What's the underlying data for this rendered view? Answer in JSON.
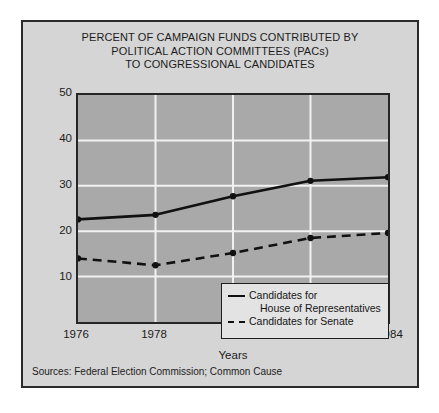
{
  "figure": {
    "title_lines": [
      "PERCENT OF CAMPAIGN FUNDS CONTRIBUTED BY",
      "POLITICAL ACTION COMMITTEES (PACs)",
      "TO CONGRESSIONAL CANDIDATES"
    ],
    "source_note": "Sources: Federal Election Commission; Common Cause",
    "colors": {
      "page_background": "#ffffff",
      "frame_background": "#d5d5d5",
      "plot_background": "#a9a9a9",
      "gridline": "#f2f2f2",
      "line": "#111111",
      "frame_border": "#2b2b2b",
      "legend_background": "#e3e3e3"
    }
  },
  "legend": {
    "position": "inside-bottom-right",
    "entries": [
      {
        "style": "solid",
        "label_line1": "Candidates for",
        "label_line2": "House of Representatives"
      },
      {
        "style": "dashed",
        "label_line1": "Candidates for Senate",
        "label_line2": ""
      }
    ]
  },
  "chart_data": {
    "type": "line",
    "title": "PERCENT OF CAMPAIGN FUNDS CONTRIBUTED BY POLITICAL ACTION COMMITTEES (PACs) TO CONGRESSIONAL CANDIDATES",
    "xlabel": "Years",
    "ylabel": "Percent of Total Campaign Funds",
    "x": [
      1976,
      1978,
      1980,
      1982,
      1984
    ],
    "categories": [
      "1976",
      "1978",
      "1980",
      "1982",
      "1984"
    ],
    "xtick_labels": [
      "1976",
      "1978",
      "1980",
      "1982",
      "1984"
    ],
    "ytick_labels": [
      "10",
      "20",
      "30",
      "40",
      "50"
    ],
    "yticks": [
      10,
      20,
      30,
      40,
      50
    ],
    "ylim": [
      0,
      50
    ],
    "xlim": [
      1976,
      1984
    ],
    "grid": true,
    "grid_axis": "y",
    "legend_position": "inside-bottom-right",
    "series": [
      {
        "name": "Candidates for House of Representatives",
        "style": "solid",
        "values": [
          22.6,
          23.6,
          27.7,
          31.1,
          31.9
        ]
      },
      {
        "name": "Candidates for Senate",
        "style": "dashed",
        "values": [
          14.0,
          12.5,
          15.2,
          18.5,
          19.6
        ]
      }
    ]
  }
}
